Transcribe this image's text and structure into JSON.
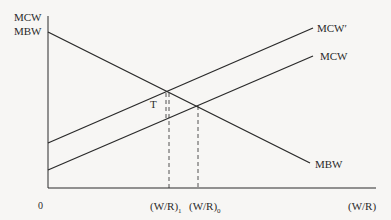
{
  "diagram": {
    "type": "supply-demand style economics diagram",
    "y_axis_labels": [
      "MCW",
      "MBW"
    ],
    "x_axis_label": "(W/R)",
    "origin_label": "0",
    "curves": [
      {
        "name": "MBW",
        "label": "MBW",
        "slope": "downward"
      },
      {
        "name": "MCW",
        "label": "MCW",
        "slope": "upward"
      },
      {
        "name": "MCW_prime",
        "label": "MCW′",
        "slope": "upward",
        "note": "shifted up by T"
      }
    ],
    "annotations": {
      "tax_label": "T",
      "x_tick_1": {
        "base": "(W/R)",
        "sub": "1"
      },
      "x_tick_0": {
        "base": "(W/R)",
        "sub": "0"
      }
    },
    "colors": {
      "line": "#2a2a2a",
      "background": "#f7f6f4"
    }
  }
}
